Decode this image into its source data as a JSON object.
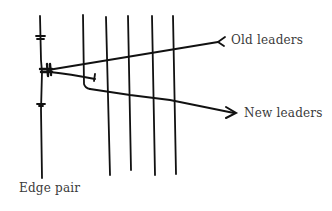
{
  "diagram": {
    "labels": {
      "old_leaders": "Old leaders",
      "new_leaders": "New leaders",
      "edge_pair": "Edge pair"
    },
    "elements": {
      "edge_pair_line": "edge-pair-vertical",
      "cross_lines_count": 5,
      "old_leaders_marker": "feathered-tail",
      "new_leaders_marker": "arrowhead"
    },
    "stroke_color": "#111111",
    "text_color": "#3a3a3a"
  }
}
